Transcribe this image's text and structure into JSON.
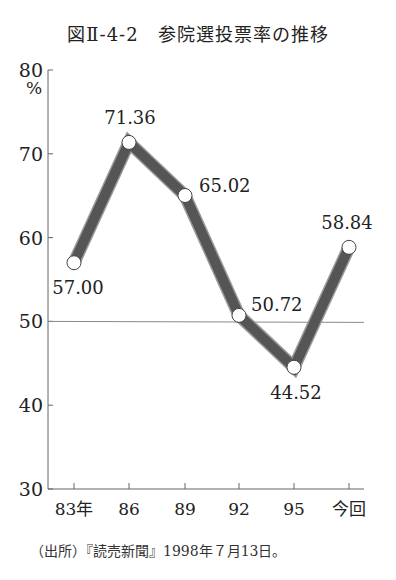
{
  "figure": {
    "title": "図Ⅱ‐4‐2　参院選投票率の推移",
    "source": "（出所）『読売新聞』1998年７月13日。",
    "unit_label": "%"
  },
  "style": {
    "line_color": "#555555",
    "line_outline": "#999999",
    "marker_fill": "#ffffff",
    "axis_color": "#666666",
    "reference_line_color": "#888888"
  },
  "chart_data": {
    "type": "line",
    "title": "参院選投票率の推移",
    "xlabel": "",
    "ylabel": "%",
    "categories": [
      "83年",
      "86",
      "89",
      "92",
      "95",
      "今回"
    ],
    "series": [
      {
        "name": "投票率",
        "values": [
          57.0,
          71.36,
          65.02,
          50.72,
          44.52,
          58.84
        ]
      }
    ],
    "data_labels": [
      "57.00",
      "71.36",
      "65.02",
      "50.72",
      "44.52",
      "58.84"
    ],
    "ylim": [
      30,
      80
    ],
    "yticks": [
      30,
      40,
      50,
      60,
      70,
      80
    ],
    "reference_line": 50,
    "grid": false,
    "legend": "none"
  }
}
